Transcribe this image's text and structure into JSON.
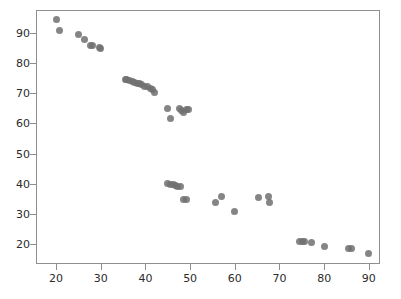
{
  "chart_data": {
    "type": "scatter",
    "title": "",
    "xlabel": "",
    "ylabel": "",
    "xlim": [
      15.5,
      92.5
    ],
    "ylim": [
      13.5,
      97.5
    ],
    "xticks": [
      20,
      30,
      40,
      50,
      60,
      70,
      80,
      90
    ],
    "yticks": [
      20,
      30,
      40,
      50,
      60,
      70,
      80,
      90
    ],
    "xticklabels": [
      "20",
      "30",
      "40",
      "50",
      "60",
      "70",
      "80",
      "90"
    ],
    "yticklabels": [
      "20",
      "30",
      "40",
      "50",
      "60",
      "70",
      "80",
      "90"
    ],
    "grid": false,
    "legend": null,
    "marker": {
      "shape": "circle",
      "color": "#707070",
      "size": 7,
      "opacity": 0.85
    },
    "series": [
      {
        "name": "series-1",
        "points": [
          [
            19.8,
            94.8
          ],
          [
            20.5,
            90.9
          ],
          [
            24.8,
            89.7
          ],
          [
            26.2,
            88.0
          ],
          [
            27.5,
            86.2
          ],
          [
            28.0,
            86.0
          ],
          [
            29.4,
            85.4
          ],
          [
            29.8,
            85.2
          ],
          [
            35.2,
            75.0
          ],
          [
            35.6,
            74.8
          ],
          [
            36.3,
            74.6
          ],
          [
            36.9,
            74.2
          ],
          [
            37.4,
            73.9
          ],
          [
            37.9,
            73.6
          ],
          [
            38.4,
            73.4
          ],
          [
            38.9,
            73.1
          ],
          [
            39.6,
            72.6
          ],
          [
            40.2,
            72.4
          ],
          [
            40.8,
            71.9
          ],
          [
            41.4,
            71.4
          ],
          [
            41.9,
            70.7
          ],
          [
            44.6,
            65.3
          ],
          [
            45.4,
            62.1
          ],
          [
            47.4,
            65.4
          ],
          [
            47.9,
            64.6
          ],
          [
            48.4,
            63.9
          ],
          [
            48.9,
            64.9
          ],
          [
            49.4,
            65.0
          ],
          [
            44.8,
            40.3
          ],
          [
            45.4,
            40.2
          ],
          [
            46.0,
            40.1
          ],
          [
            46.5,
            39.8
          ],
          [
            47.0,
            39.6
          ],
          [
            47.6,
            39.3
          ],
          [
            48.4,
            35.3
          ],
          [
            49.0,
            35.2
          ],
          [
            55.4,
            34.1
          ],
          [
            56.8,
            36.0
          ],
          [
            59.6,
            31.2
          ],
          [
            65.1,
            35.8
          ],
          [
            67.4,
            36.3
          ],
          [
            67.6,
            34.2
          ],
          [
            74.3,
            21.3
          ],
          [
            74.9,
            21.3
          ],
          [
            75.4,
            21.3
          ],
          [
            76.9,
            21.1
          ],
          [
            79.9,
            19.7
          ],
          [
            85.2,
            19.1
          ],
          [
            85.8,
            19.1
          ],
          [
            89.6,
            17.2
          ]
        ]
      }
    ]
  },
  "axes": {
    "left_px": 36,
    "top_px": 10,
    "width_px": 344,
    "height_px": 254,
    "frame_color": "#8e8e8e"
  }
}
